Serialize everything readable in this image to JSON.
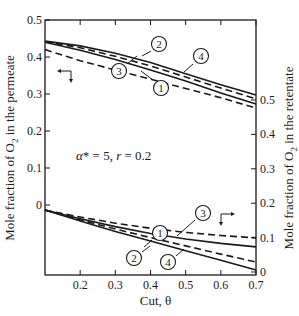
{
  "chart_data": {
    "type": "line",
    "title": "",
    "annotation": "α* = 5, r = 0.2",
    "xlabel": "Cut, θ",
    "ylabel_left": "Mole fraction of O2 in the permeate",
    "ylabel_right": "Mole fraction of O2 in the retentate",
    "xlim": [
      0.1,
      0.7
    ],
    "ylim_left": [
      -0.19,
      0.5
    ],
    "ylim_right": [
      0,
      0.5
    ],
    "x_ticks": [
      "0.2",
      "0.3",
      "0.4",
      "0.5",
      "0.6",
      "0.7"
    ],
    "y_ticks_left": [
      "0.5",
      "0.4",
      "0.3",
      "0.2",
      "0.1",
      "0"
    ],
    "y_ticks_right": [
      "0.5",
      "0.4",
      "0.3",
      "0.2",
      "0.1",
      "0"
    ],
    "grid": false,
    "x": [
      0.1,
      0.2,
      0.3,
      0.4,
      0.5,
      0.6,
      0.7
    ],
    "series": [
      {
        "name": "1 (permeate)",
        "curve_label": "1",
        "axis": "left",
        "style": "dashed",
        "values": [
          0.42,
          0.39,
          0.365,
          0.34,
          0.315,
          0.29,
          0.262
        ]
      },
      {
        "name": "2 (permeate)",
        "curve_label": "2",
        "axis": "left",
        "style": "solid",
        "values": [
          0.443,
          0.43,
          0.41,
          0.385,
          0.355,
          0.325,
          0.297
        ]
      },
      {
        "name": "3 (permeate)",
        "curve_label": "3",
        "axis": "left",
        "style": "solid",
        "values": [
          0.44,
          0.418,
          0.393,
          0.365,
          0.335,
          0.303,
          0.273
        ]
      },
      {
        "name": "4 (permeate)",
        "curve_label": "4",
        "axis": "left",
        "style": "dashed",
        "values": [
          0.442,
          0.425,
          0.402,
          0.376,
          0.346,
          0.316,
          0.287
        ]
      },
      {
        "name": "1 (retentate)",
        "curve_label": "1",
        "axis": "right",
        "style": "dashed",
        "values": [
          0.18,
          0.16,
          0.142,
          0.127,
          0.115,
          0.106,
          0.099
        ]
      },
      {
        "name": "2 (retentate)",
        "curve_label": "2",
        "axis": "right",
        "style": "solid",
        "values": [
          0.18,
          0.148,
          0.118,
          0.09,
          0.062,
          0.034,
          0.006
        ]
      },
      {
        "name": "3 (retentate)",
        "curve_label": "3",
        "axis": "right",
        "style": "solid",
        "values": [
          0.18,
          0.155,
          0.132,
          0.112,
          0.096,
          0.083,
          0.073
        ]
      },
      {
        "name": "4 (retentate)",
        "curve_label": "4",
        "axis": "right",
        "style": "dashed",
        "values": [
          0.18,
          0.152,
          0.125,
          0.1,
          0.076,
          0.052,
          0.029
        ]
      }
    ],
    "legend": "curve numbers in circles: 1, 2, 3, 4",
    "arrows": {
      "upper_curves": "left axis (permeate)",
      "lower_curves": "right axis (retentate)"
    }
  }
}
